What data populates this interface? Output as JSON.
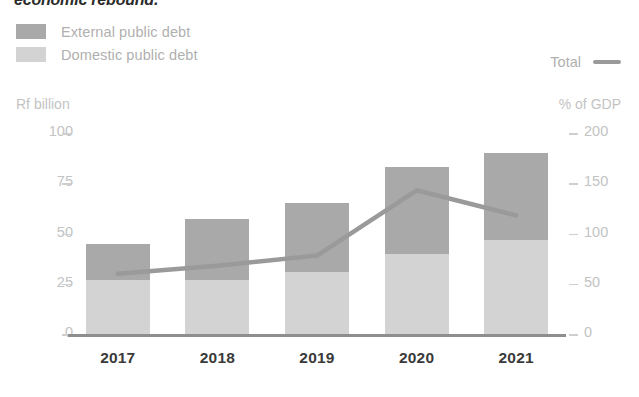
{
  "title": "economic rebound.",
  "legend": {
    "items": [
      {
        "label": "External public debt",
        "color": "#a9a9a9",
        "swatch": "legend-swatch-external"
      },
      {
        "label": "Domestic public debt",
        "color": "#d3d3d3",
        "swatch": "legend-swatch-domestic"
      }
    ],
    "total": {
      "label": "Total",
      "color": "#9a9a9a"
    }
  },
  "axes": {
    "left_caption": "Rf billion",
    "right_caption": "% of GDP",
    "left_ticks": [
      "100",
      "75",
      "50",
      "25",
      "0"
    ],
    "right_ticks": [
      "200",
      "150",
      "100",
      "50",
      "0"
    ]
  },
  "chart_data": {
    "type": "bar",
    "title": "economic rebound.",
    "subtitle": "",
    "xlabel": "",
    "ylabel": "Rf billion",
    "y2label": "% of GDP",
    "categories": [
      "2017",
      "2018",
      "2019",
      "2020",
      "2021"
    ],
    "ylim": [
      0,
      100
    ],
    "y2lim": [
      0,
      200
    ],
    "yticks": [
      0,
      25,
      50,
      75,
      100
    ],
    "y2ticks": [
      0,
      50,
      100,
      150,
      200
    ],
    "grid": false,
    "legend_position": "top-left",
    "series": [
      {
        "name": "Domestic public debt",
        "axis": "left",
        "units": "Rf billion",
        "type": "bar",
        "color": "#d3d3d3",
        "values": [
          27,
          27,
          31,
          40,
          47
        ]
      },
      {
        "name": "External public debt",
        "axis": "left",
        "units": "Rf billion",
        "type": "bar",
        "color": "#a9a9a9",
        "values": [
          18,
          30,
          34,
          43,
          43
        ]
      },
      {
        "name": "Total",
        "axis": "right",
        "units": "% of GDP",
        "type": "line",
        "color": "#9a9a9a",
        "values": [
          60,
          68,
          78,
          143,
          118
        ]
      }
    ],
    "stacked_totals": [
      45,
      57,
      65,
      83,
      90
    ]
  }
}
